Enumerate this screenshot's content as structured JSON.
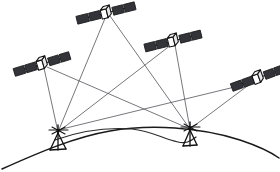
{
  "figure": {
    "type": "technical-line-diagram",
    "width": 280,
    "height": 172,
    "background_color": "#ffffff",
    "line_color": "#4a4a52",
    "earth_line_color": "#1a1a1a",
    "satellite_outline_color": "#111111",
    "solar_panel_fill": "#33333a"
  },
  "satellites": [
    {
      "id": "satellite-top",
      "label": "Satellite 1",
      "body_x": 106,
      "body_y": 13,
      "panel_angle_deg": -14,
      "panel_span": 30,
      "panel_segments": 2
    },
    {
      "id": "satellite-left",
      "label": "Satellite 2",
      "body_x": 42,
      "body_y": 64,
      "panel_angle_deg": -17,
      "panel_span": 29,
      "panel_segments": 2
    },
    {
      "id": "satellite-right-upper",
      "label": "Satellite 3",
      "body_x": 173,
      "body_y": 41,
      "panel_angle_deg": -14,
      "panel_span": 29,
      "panel_segments": 2
    },
    {
      "id": "satellite-far-right",
      "label": "Satellite 4",
      "body_x": 258,
      "body_y": 78,
      "panel_angle_deg": -20,
      "panel_span": 28,
      "panel_segments": 2
    }
  ],
  "ground_stations": [
    {
      "id": "ground-station-left",
      "label": "Ground Station A",
      "x": 58,
      "y": 132,
      "tripod_height": 16,
      "tripod_half_width": 10
    },
    {
      "id": "ground-station-right",
      "label": "Ground Station B",
      "x": 190,
      "y": 129,
      "tripod_height": 15,
      "tripod_half_width": 9
    }
  ],
  "signal_links": [
    {
      "id": "link-sat1-stationA",
      "from": "satellite-top",
      "to": "ground-station-left"
    },
    {
      "id": "link-sat1-stationB",
      "from": "satellite-top",
      "to": "ground-station-right"
    },
    {
      "id": "link-sat2-stationA",
      "from": "satellite-left",
      "to": "ground-station-left"
    },
    {
      "id": "link-sat2-stationB",
      "from": "satellite-left",
      "to": "ground-station-right"
    },
    {
      "id": "link-sat3-stationA",
      "from": "satellite-right-upper",
      "to": "ground-station-left"
    },
    {
      "id": "link-sat3-stationB",
      "from": "satellite-right-upper",
      "to": "ground-station-right"
    },
    {
      "id": "link-sat4-stationA",
      "from": "satellite-far-right",
      "to": "ground-station-left"
    },
    {
      "id": "link-sat4-stationB",
      "from": "satellite-far-right",
      "to": "ground-station-right"
    }
  ],
  "earth": {
    "surface_label": "Earth surface",
    "surface_path": "M 2 169 C 40 152 75 137 110 131 C 150 124 200 127 240 140 C 258 146 272 153 279 158",
    "geoid_label": "Geoid / terrain undulation",
    "geoid_path": "M 55 140 C 80 131 105 127 132 129 C 152 131 163 139 178 142 C 186 144 191 141 196 137"
  }
}
